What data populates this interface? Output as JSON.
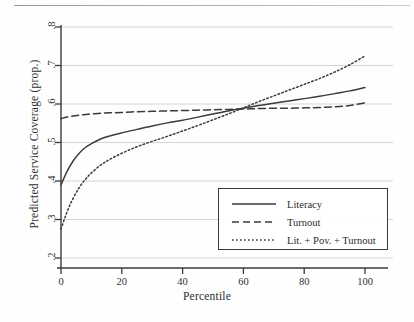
{
  "chart_data": {
    "type": "line",
    "title": "",
    "xlabel": "Percentile",
    "ylabel": "Predicted Service Coverage (prop.)",
    "xlim": [
      0,
      100
    ],
    "ylim": [
      0.2,
      0.8
    ],
    "xticks": [
      "0",
      "20",
      "40",
      "60",
      "80",
      "100"
    ],
    "xtick_values": [
      0,
      20,
      40,
      60,
      80,
      100
    ],
    "yticks": [
      ".2",
      ".3",
      ".4",
      ".5",
      ".6",
      ".7",
      ".8"
    ],
    "ytick_values": [
      0.2,
      0.3,
      0.4,
      0.5,
      0.6,
      0.7,
      0.8
    ],
    "grid": true,
    "grid_axis": "y",
    "legend_position": "lower right",
    "x": [
      0,
      2,
      4,
      6,
      8,
      10,
      13,
      16,
      20,
      25,
      30,
      35,
      40,
      45,
      50,
      55,
      60,
      65,
      70,
      75,
      80,
      85,
      90,
      95,
      100
    ],
    "series": [
      {
        "name": "Literacy",
        "style": "solid",
        "color": "#3a3a3a",
        "values": [
          0.39,
          0.425,
          0.452,
          0.472,
          0.487,
          0.497,
          0.509,
          0.517,
          0.525,
          0.534,
          0.543,
          0.551,
          0.558,
          0.566,
          0.574,
          0.582,
          0.589,
          0.596,
          0.602,
          0.608,
          0.614,
          0.62,
          0.627,
          0.634,
          0.643
        ]
      },
      {
        "name": "Turnout",
        "style": "dashed",
        "color": "#3a3a3a",
        "values": [
          0.562,
          0.566,
          0.569,
          0.571,
          0.573,
          0.574,
          0.576,
          0.577,
          0.578,
          0.58,
          0.581,
          0.582,
          0.583,
          0.584,
          0.585,
          0.586,
          0.587,
          0.588,
          0.589,
          0.589,
          0.59,
          0.591,
          0.593,
          0.596,
          0.603
        ]
      },
      {
        "name": "Lit. + Pov. + Turnout",
        "style": "dotted",
        "color": "#3a3a3a",
        "values": [
          0.275,
          0.32,
          0.355,
          0.383,
          0.404,
          0.421,
          0.441,
          0.456,
          0.472,
          0.489,
          0.503,
          0.516,
          0.53,
          0.544,
          0.559,
          0.574,
          0.59,
          0.606,
          0.621,
          0.636,
          0.651,
          0.666,
          0.683,
          0.702,
          0.725
        ]
      }
    ]
  },
  "legend": {
    "entries": [
      {
        "label": "Literacy",
        "style": "solid"
      },
      {
        "label": "Turnout",
        "style": "dashed"
      },
      {
        "label": "Lit. + Pov. + Turnout",
        "style": "dotted"
      }
    ]
  },
  "colors": {
    "line": "#3a3a3a",
    "grid": "#d0d0d0",
    "axis": "#3a3a3a",
    "background": "#fefefe"
  }
}
